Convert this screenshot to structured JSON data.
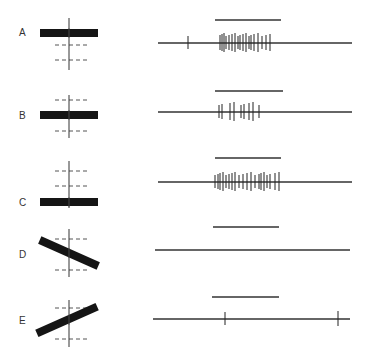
{
  "figure": {
    "rows": [
      {
        "label": "A",
        "label_pos": [
          19,
          33
        ],
        "orientation": {
          "cx": 69,
          "cy": 33,
          "angle": 0,
          "bar_len": 58
        },
        "dashed_lines": [
          45,
          60
        ],
        "axis_range": [
          18,
          70
        ],
        "stimulus": {
          "y": 20,
          "x1": 215,
          "x2": 281
        },
        "trace": {
          "y": 43,
          "x1": 158,
          "x2": 352
        },
        "spikes": [
          188,
          220,
          222,
          224,
          226,
          229,
          232,
          235,
          238,
          240,
          243,
          246,
          249,
          251,
          254,
          258,
          262,
          266,
          270
        ],
        "response": "strong"
      },
      {
        "label": "B",
        "label_pos": [
          19,
          116
        ],
        "orientation": {
          "cx": 69,
          "cy": 115,
          "angle": 0,
          "bar_len": 58
        },
        "dashed_lines": [
          100,
          131
        ],
        "axis_range": [
          95,
          138
        ],
        "stimulus": {
          "y": 91,
          "x1": 215,
          "x2": 283
        },
        "trace": {
          "y": 112,
          "x1": 158,
          "x2": 352
        },
        "spikes": [
          219,
          222,
          230,
          234,
          241,
          244,
          249,
          253,
          259
        ],
        "response": "moderate"
      },
      {
        "label": "C",
        "label_pos": [
          19,
          203
        ],
        "orientation": {
          "cx": 69,
          "cy": 202,
          "angle": 0,
          "bar_len": 58
        },
        "dashed_lines": [
          171,
          186
        ],
        "axis_range": [
          161,
          208
        ],
        "stimulus": {
          "y": 158,
          "x1": 215,
          "x2": 281
        },
        "trace": {
          "y": 182,
          "x1": 158,
          "x2": 352
        },
        "spikes": [
          215,
          218,
          220,
          223,
          226,
          229,
          232,
          235,
          239,
          243,
          247,
          251,
          255,
          259,
          261,
          264,
          267,
          270,
          275,
          279
        ],
        "response": "strong"
      },
      {
        "label": "D",
        "label_pos": [
          19,
          255
        ],
        "orientation": {
          "cx": 69,
          "cy": 253,
          "angle": 24,
          "bar_len": 64
        },
        "dashed_lines": [
          239,
          270
        ],
        "axis_range": [
          229,
          277
        ],
        "stimulus": {
          "y": 227,
          "x1": 213,
          "x2": 279
        },
        "trace": {
          "y": 250,
          "x1": 155,
          "x2": 350
        },
        "spikes": [],
        "response": "none"
      },
      {
        "label": "E",
        "label_pos": [
          19,
          321
        ],
        "orientation": {
          "cx": 67,
          "cy": 320,
          "angle": -24,
          "bar_len": 66
        },
        "dashed_lines": [
          308,
          339
        ],
        "axis_range": [
          300,
          347
        ],
        "stimulus": {
          "y": 297,
          "x1": 212,
          "x2": 279
        },
        "trace": {
          "y": 319,
          "x1": 153,
          "x2": 350
        },
        "spikes": [
          225,
          338
        ],
        "response": "weak"
      }
    ],
    "colors": {
      "bar": "#151515",
      "line": "#333333",
      "dash": "#555555"
    }
  }
}
